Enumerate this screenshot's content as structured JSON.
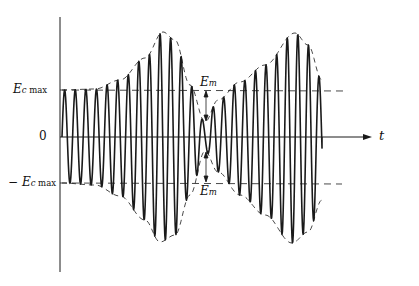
{
  "diagram": {
    "type": "amplitude-modulated-waveform",
    "labels": {
      "ec_max": {
        "main": "E",
        "sub_c": "c",
        "sub_max": " max"
      },
      "neg_ec_max": {
        "prefix": "− ",
        "main": "E",
        "sub_c": "c",
        "sub_max": " max"
      },
      "zero": "0",
      "time_axis": "t",
      "em_top": {
        "main": "E",
        "sub": "m"
      },
      "em_bottom": {
        "main": "E",
        "sub": "m"
      }
    },
    "geometry": {
      "axis_x": 60,
      "zero_y": 137,
      "ec_max_y": 90,
      "neg_ec_max_y": 183,
      "wave_start_x": 62,
      "wave_end_x": 322,
      "axis_end_x": 372,
      "carrier_period": 10.6,
      "envelope_top": [
        [
          62,
          90
        ],
        [
          95,
          89
        ],
        [
          120,
          80
        ],
        [
          145,
          58
        ],
        [
          163,
          32
        ],
        [
          175,
          40
        ],
        [
          190,
          85
        ],
        [
          205,
          122
        ],
        [
          218,
          100
        ],
        [
          240,
          82
        ],
        [
          265,
          65
        ],
        [
          295,
          33
        ],
        [
          308,
          45
        ],
        [
          322,
          80
        ]
      ],
      "envelope_bottom": [
        [
          62,
          183
        ],
        [
          95,
          185
        ],
        [
          120,
          196
        ],
        [
          145,
          220
        ],
        [
          160,
          242
        ],
        [
          175,
          235
        ],
        [
          190,
          195
        ],
        [
          205,
          151
        ],
        [
          218,
          172
        ],
        [
          240,
          195
        ],
        [
          265,
          215
        ],
        [
          292,
          243
        ],
        [
          308,
          232
        ],
        [
          322,
          200
        ]
      ]
    },
    "colors": {
      "stroke": "#1a1a1a",
      "background": "#ffffff"
    }
  }
}
